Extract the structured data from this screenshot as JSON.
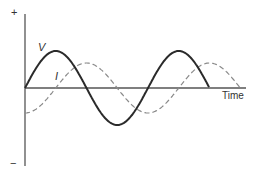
{
  "diagram": {
    "type": "ac-phase-diagram",
    "axes": {
      "y_positive_label": "+",
      "y_negative_label": "−",
      "x_label": "Time"
    },
    "series": [
      {
        "name": "voltage",
        "label": "V",
        "style": "solid",
        "color": "#2a2a2a",
        "amplitude_px": 37,
        "phase_deg": 0,
        "cycles": 1.5
      },
      {
        "name": "current",
        "label": "I",
        "style": "dashed",
        "color": "#8a8a8a",
        "amplitude_px": 25,
        "phase_deg": -90,
        "cycles": 1.75
      }
    ],
    "geometry": {
      "origin_x": 25,
      "origin_y": 88,
      "period_px": 123,
      "y_axis_top": 14,
      "y_axis_bottom": 166,
      "x_axis_end": 246
    }
  }
}
